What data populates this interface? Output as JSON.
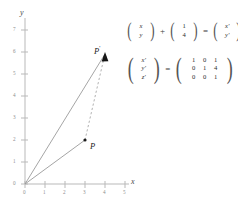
{
  "figure": {
    "axes": {
      "x_name": "x",
      "y_name": "y",
      "x_ticks": [
        "0",
        "1",
        "2",
        "3",
        "4",
        "5"
      ],
      "y_ticks": [
        "0",
        "1",
        "2",
        "3",
        "4",
        "5",
        "6",
        "7"
      ],
      "xlim": [
        0,
        5
      ],
      "ylim": [
        0,
        7
      ]
    },
    "points": [
      {
        "label": "P",
        "prime": "",
        "x": 3,
        "y": 2
      },
      {
        "label": "P",
        "prime": "'",
        "x": 4,
        "y": 6
      }
    ],
    "segments": [
      {
        "name": "origin-to-P",
        "style": "solid",
        "from": [
          0,
          0
        ],
        "to": [
          3,
          2
        ]
      },
      {
        "name": "origin-to-P-prime",
        "style": "solid",
        "from": [
          0,
          0
        ],
        "to": [
          4,
          6
        ]
      },
      {
        "name": "P-to-P-prime",
        "style": "dashed",
        "from": [
          3,
          2
        ],
        "to": [
          4,
          6
        ]
      }
    ]
  },
  "equations": {
    "translation": {
      "vector_in": [
        "x",
        "y"
      ],
      "plus": "+",
      "offset": [
        "1",
        "4"
      ],
      "equals": "=",
      "vector_out": [
        "x'",
        "y'"
      ]
    },
    "homogeneous": {
      "vector_out": [
        "x'",
        "y'",
        "z'"
      ],
      "equals": "=",
      "matrix": [
        [
          "1",
          "0",
          "1"
        ],
        [
          "0",
          "1",
          "4"
        ],
        [
          "0",
          "0",
          "1"
        ]
      ],
      "vector_in": [
        "x",
        "y",
        "z"
      ]
    }
  },
  "colors": {
    "axis": "#b9b9b9",
    "ray": "#9a9a9a",
    "dashed": "#a8a8a8",
    "point": "#1a1a1a",
    "text": "#3c3c3c",
    "tick_text": "#8e8e8e"
  }
}
